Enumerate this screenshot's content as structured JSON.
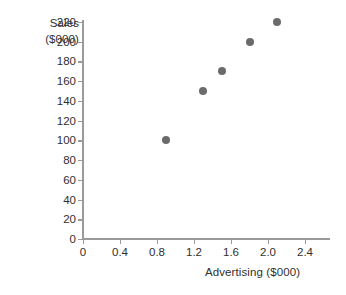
{
  "chart_data": {
    "type": "scatter",
    "title": "",
    "xlabel": "Advertising ($000)",
    "ylabel": "Sales ($000)",
    "ylabel_lines": [
      "Sales",
      "($000)"
    ],
    "x": [
      0.9,
      1.3,
      1.5,
      1.8,
      2.1
    ],
    "values": [
      100,
      150,
      170,
      200,
      220
    ],
    "points": [
      {
        "x": 0.9,
        "y": 100
      },
      {
        "x": 1.3,
        "y": 150
      },
      {
        "x": 1.5,
        "y": 170
      },
      {
        "x": 1.8,
        "y": 200
      },
      {
        "x": 2.1,
        "y": 220
      }
    ],
    "xlim": [
      0,
      2.67
    ],
    "ylim": [
      0,
      220
    ],
    "xticks": [
      0,
      0.4,
      0.8,
      1.2,
      1.6,
      2.0,
      2.4
    ],
    "xticklabels": [
      "0",
      "0.4",
      "0.8",
      "1.2",
      "1.6",
      "2.0",
      "2.4"
    ],
    "yticks": [
      0,
      20,
      40,
      60,
      80,
      100,
      120,
      140,
      160,
      180,
      200,
      220
    ],
    "yticklabels": [
      "0",
      "20",
      "40",
      "60",
      "80",
      "100",
      "120",
      "140",
      "160",
      "180",
      "200",
      "220"
    ],
    "grid": false,
    "legend": false,
    "marker_color": "#6b6b6b",
    "axis_color": "#9a9a9a",
    "text_color": "#2f2f2f",
    "background_color": "#ffffff"
  }
}
